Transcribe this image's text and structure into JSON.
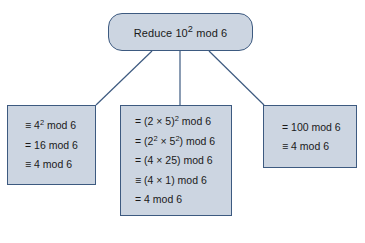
{
  "diagram": {
    "title_node": {
      "text": "Reduce 10² mod 6",
      "text_plain": "Reduce 10^2 mod 6"
    },
    "colors": {
      "node_fill": "#ccd5e1",
      "node_border": "#3d5a80",
      "connector": "#3d5a80",
      "background": "#ffffff",
      "text": "#1a1a1a"
    },
    "branches": [
      {
        "id": "left",
        "name": "square-then-reduce",
        "lines": [
          "≡ 4² mod 6",
          "= 16 mod 6",
          "≡ 4 mod 6"
        ]
      },
      {
        "id": "middle",
        "name": "factor-then-reduce",
        "lines": [
          "= (2 × 5)² mod 6",
          "= (2² × 5²) mod 6",
          "= (4 × 25) mod 6",
          "≡ (4 × 1) mod 6",
          "= 4 mod 6"
        ]
      },
      {
        "id": "right",
        "name": "expand-then-reduce",
        "lines": [
          "= 100 mod 6",
          "≡ 4 mod 6"
        ]
      }
    ]
  }
}
